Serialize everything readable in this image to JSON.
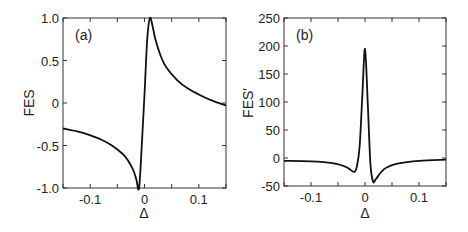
{
  "chart_data": [
    {
      "type": "line",
      "panel_label": "(a)",
      "xlabel": "Δ",
      "ylabel": "FES",
      "xlim": [
        -0.15,
        0.15
      ],
      "ylim": [
        -1.0,
        1.0
      ],
      "xticks": [
        -0.1,
        0,
        0.1
      ],
      "xtick_labels": [
        "-0.1",
        "0",
        "0.1"
      ],
      "xminor": [
        -0.15,
        -0.1,
        -0.05,
        0,
        0.05,
        0.1,
        0.15
      ],
      "yticks": [
        1.0,
        0.5,
        0,
        -0.5,
        -1.0
      ],
      "ytick_labels": [
        "1.0",
        "0.5",
        "0",
        "-0.5",
        "-1.0"
      ],
      "grid": false,
      "series": [
        {
          "name": "FES",
          "x": [
            -0.15,
            -0.12,
            -0.1,
            -0.08,
            -0.06,
            -0.04,
            -0.03,
            -0.02,
            -0.015,
            -0.01,
            -0.005,
            0,
            0.005,
            0.01,
            0.015,
            0.02,
            0.03,
            0.04,
            0.06,
            0.08,
            0.1,
            0.12,
            0.15
          ],
          "y": [
            -0.3,
            -0.34,
            -0.38,
            -0.43,
            -0.5,
            -0.6,
            -0.68,
            -0.8,
            -0.9,
            -1.0,
            -0.5,
            0.1,
            0.75,
            1.0,
            0.9,
            0.75,
            0.55,
            0.42,
            0.27,
            0.17,
            0.1,
            0.04,
            -0.03
          ]
        }
      ]
    },
    {
      "type": "line",
      "panel_label": "(b)",
      "xlabel": "Δ",
      "ylabel": "FES′",
      "xlim": [
        -0.15,
        0.15
      ],
      "ylim": [
        -50,
        250
      ],
      "xticks": [
        -0.1,
        0,
        0.1
      ],
      "xtick_labels": [
        "-0.1",
        "0",
        "0.1"
      ],
      "xminor": [
        -0.15,
        -0.1,
        -0.05,
        0,
        0.05,
        0.1,
        0.15
      ],
      "yticks": [
        250,
        200,
        150,
        100,
        50,
        0,
        -50
      ],
      "ytick_labels": [
        "250",
        "200",
        "150",
        "100",
        "50",
        "0",
        "-50"
      ],
      "grid": false,
      "series": [
        {
          "name": "FES′",
          "x": [
            -0.15,
            -0.1,
            -0.06,
            -0.04,
            -0.03,
            -0.02,
            -0.015,
            -0.01,
            -0.005,
            0,
            0.005,
            0.01,
            0.015,
            0.02,
            0.03,
            0.04,
            0.06,
            0.1,
            0.15
          ],
          "y": [
            -5,
            -6,
            -9,
            -14,
            -19,
            -25,
            -15,
            20,
            110,
            195,
            100,
            -10,
            -42,
            -38,
            -25,
            -17,
            -10,
            -5,
            -3
          ]
        }
      ]
    }
  ]
}
